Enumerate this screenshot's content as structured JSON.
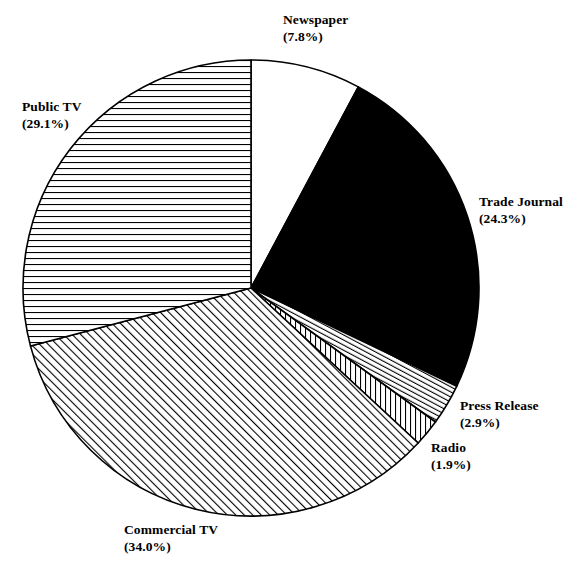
{
  "chart_data": {
    "type": "pie",
    "title": "",
    "legend_position": "none",
    "start_angle_deg": 0,
    "direction": "clockwise",
    "categories": [
      "Newspaper",
      "Trade Journal",
      "Press Release",
      "Radio",
      "Commercial TV",
      "Public TV"
    ],
    "values": [
      7.8,
      24.3,
      2.9,
      1.9,
      34.0,
      29.1
    ],
    "unit": "%",
    "slices": [
      {
        "label": "Newspaper",
        "percent_text": "(7.8%)",
        "value": 7.8,
        "fill": "solid-white",
        "fill_color": "#ffffff",
        "stroke_color": "#000000"
      },
      {
        "label": "Trade Journal",
        "percent_text": "(24.3%)",
        "value": 24.3,
        "fill": "solid-black",
        "fill_color": "#000000",
        "stroke_color": "#000000"
      },
      {
        "label": "Press Release",
        "percent_text": "(2.9%)",
        "value": 2.9,
        "fill": "diagonal-hatch-steep",
        "fill_color": "#ffffff",
        "stroke_color": "#000000"
      },
      {
        "label": "Radio",
        "percent_text": "(1.9%)",
        "value": 1.9,
        "fill": "vertical-hatch",
        "fill_color": "#ffffff",
        "stroke_color": "#000000"
      },
      {
        "label": "Commercial TV",
        "percent_text": "(34.0%)",
        "value": 34.0,
        "fill": "diagonal-hatch",
        "fill_color": "#ffffff",
        "stroke_color": "#000000"
      },
      {
        "label": "Public TV",
        "percent_text": "(29.1%)",
        "value": 29.1,
        "fill": "horizontal-hatch",
        "fill_color": "#ffffff",
        "stroke_color": "#000000"
      }
    ]
  },
  "labels": {
    "newspaper": {
      "name": "Newspaper",
      "pct": "(7.8%)"
    },
    "trade_journal": {
      "name": "Trade Journal",
      "pct": "(24.3%)"
    },
    "press_release": {
      "name": "Press Release",
      "pct": "(2.9%)"
    },
    "radio": {
      "name": "Radio",
      "pct": "(1.9%)"
    },
    "commercial_tv": {
      "name": "Commercial TV",
      "pct": "(34.0%)"
    },
    "public_tv": {
      "name": "Public TV",
      "pct": "(29.1%)"
    }
  }
}
